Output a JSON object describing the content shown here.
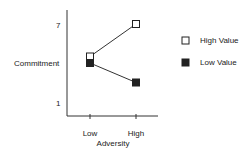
{
  "chart_data": {
    "type": "line",
    "title": "",
    "xlabel": "Adversity",
    "ylabel": "Commitment",
    "categories": [
      "Low",
      "High"
    ],
    "y_ticks": [
      "1",
      "7"
    ],
    "ylim": [
      1,
      7
    ],
    "grid": false,
    "legend_position": "right",
    "series": [
      {
        "name": "High Value",
        "marker": "open-square",
        "values": [
          4.5,
          7
        ]
      },
      {
        "name": "Low Value",
        "marker": "filled-square",
        "values": [
          4,
          2.5
        ]
      }
    ]
  }
}
